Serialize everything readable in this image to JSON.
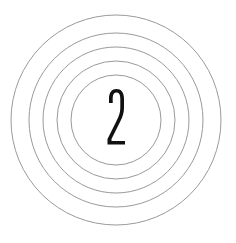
{
  "figure": {
    "digit": "2",
    "ring_count": 5,
    "center": {
      "x": 116,
      "y": 120
    },
    "ring_radii": [
      105,
      87,
      73,
      59,
      45
    ],
    "ring_color": "#9a9a9a",
    "digit_color": "#111111",
    "background": "#ffffff"
  }
}
